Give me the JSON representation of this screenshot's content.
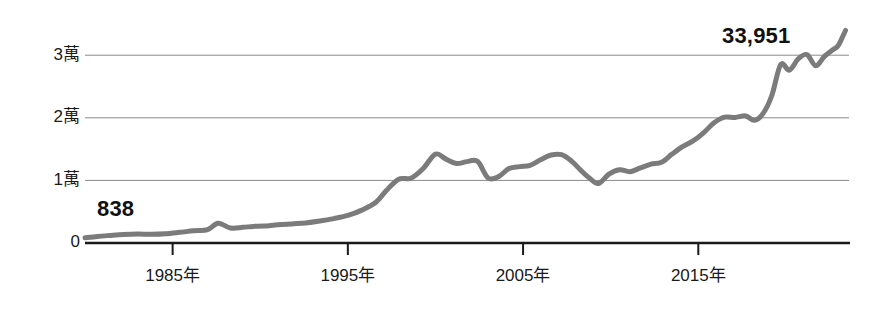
{
  "chart_data": {
    "type": "line",
    "title": "",
    "subtitle": "",
    "xlabel": "",
    "ylabel": "",
    "grid": true,
    "legend": null,
    "xlim": [
      1980,
      2023.6
    ],
    "ylim": [
      0,
      34500
    ],
    "y_ticks": [
      0,
      10000,
      20000,
      30000
    ],
    "y_tick_labels": [
      "0",
      "1萬",
      "2萬",
      "3萬"
    ],
    "x_ticks": [
      1985,
      1995,
      2005,
      2015
    ],
    "x_tick_labels": [
      "1985年",
      "1995年",
      "2005年",
      "2015年"
    ],
    "unit_note": "萬 = 10,000",
    "annotations": [
      {
        "name": "start-value",
        "text": "838",
        "x": 1980.0,
        "y": 838
      },
      {
        "name": "end-value",
        "text": "33,951",
        "x": 2023.4,
        "y": 33951
      }
    ],
    "line_color": "#7b7b7b",
    "line_width": 5,
    "axis_color": "#1a1a1a",
    "grid_color": "#8a8a8a",
    "series": [
      {
        "name": "index",
        "x": [
          1980.0,
          1980.7,
          1981.4,
          1982.2,
          1983.0,
          1983.8,
          1984.6,
          1985.4,
          1986.2,
          1987.0,
          1987.6,
          1988.3,
          1989.0,
          1989.6,
          1990.2,
          1991.0,
          1991.8,
          1992.6,
          1993.4,
          1994.2,
          1995.0,
          1995.8,
          1996.6,
          1997.2,
          1997.9,
          1998.6,
          1999.3,
          2000.0,
          2000.6,
          2001.2,
          2001.8,
          2002.4,
          2003.0,
          2003.6,
          2004.2,
          2004.8,
          2005.4,
          2006.0,
          2006.6,
          2007.2,
          2007.8,
          2008.3,
          2008.8,
          2009.3,
          2009.9,
          2010.5,
          2011.1,
          2011.7,
          2012.3,
          2012.9,
          2013.5,
          2014.1,
          2014.7,
          2015.3,
          2015.9,
          2016.5,
          2017.1,
          2017.7,
          2018.2,
          2018.7,
          2019.2,
          2019.7,
          2020.2,
          2020.7,
          2021.2,
          2021.7,
          2022.2,
          2022.7,
          2023.0,
          2023.4
        ],
        "y": [
          838,
          1050,
          1200,
          1350,
          1420,
          1390,
          1480,
          1700,
          1950,
          2150,
          3150,
          2400,
          2500,
          2650,
          2700,
          2900,
          3050,
          3200,
          3500,
          3900,
          4400,
          5250,
          6500,
          8400,
          10200,
          10350,
          11900,
          14200,
          13400,
          12700,
          13000,
          13050,
          10400,
          10600,
          11900,
          12200,
          12400,
          13300,
          14050,
          14100,
          13000,
          11600,
          10350,
          9500,
          11000,
          11700,
          11400,
          12000,
          12600,
          12900,
          14200,
          15400,
          16300,
          17600,
          19200,
          20100,
          20050,
          20300,
          19600,
          20700,
          23600,
          28500,
          27600,
          29400,
          30100,
          28300,
          29800,
          30900,
          31600,
          33951
        ]
      }
    ]
  },
  "geometry": {
    "plot_left": 85,
    "plot_right": 849,
    "y0_pixel": 243,
    "y_per_10k_pixels": 62.6
  }
}
